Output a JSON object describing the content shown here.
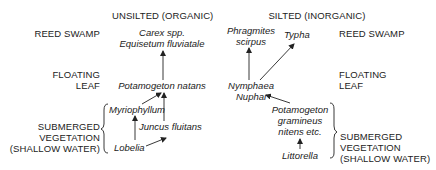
{
  "columns": {
    "unsilted": "UNSILTED (ORGANIC)",
    "silted": "SILTED (INORGANIC)"
  },
  "zones_left": {
    "reed_swamp": "REED SWAMP",
    "floating_leaf": [
      "FLOATING",
      "LEAF"
    ],
    "submerged": [
      "SUBMERGED",
      "VEGETATION",
      "(SHALLOW WATER)"
    ]
  },
  "zones_right": {
    "reed_swamp": "REED SWAMP",
    "floating_leaf": [
      "FLOATING",
      "LEAF"
    ],
    "submerged": [
      "SUBMERGED",
      "VEGETATION",
      "(SHALLOW WATER)"
    ]
  },
  "unsilted_species": {
    "reed": [
      "Carex spp.",
      "Equisetum fluviatale"
    ],
    "floating": "Potamogeton natans",
    "myriophyllum": "Myriophyllum",
    "juncus": "Juncus fluitans",
    "lobelia": "Lobelia"
  },
  "silted_species": {
    "phragmites": [
      "Phragmites",
      "scirpus"
    ],
    "typha": "Typha",
    "nymphaea": [
      "Nymphaea",
      "Nuphar"
    ],
    "potamogeton": [
      "Potamogeton",
      "gramineus",
      "nitens etc."
    ],
    "littorella": "Littorella"
  },
  "colors": {
    "text": "#222222",
    "lines": "#222222",
    "background": "#ffffff"
  }
}
